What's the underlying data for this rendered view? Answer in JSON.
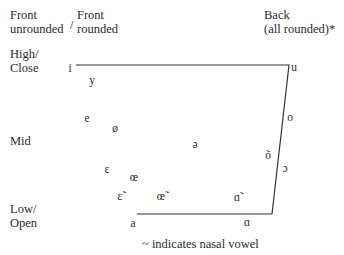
{
  "headers": {
    "front_unrounded": [
      "Front",
      "unrounded"
    ],
    "slash": "/",
    "front_rounded": [
      "Front",
      "rounded"
    ],
    "back": [
      "Back",
      "(all rounded)*"
    ]
  },
  "heights": {
    "high": [
      "High/",
      "Close"
    ],
    "mid": "Mid",
    "low": [
      "Low/",
      "Open"
    ]
  },
  "vowels": [
    {
      "symbol": "i",
      "x": 70,
      "y": 68
    },
    {
      "symbol": "y",
      "x": 92,
      "y": 80
    },
    {
      "symbol": "u",
      "x": 294,
      "y": 67
    },
    {
      "symbol": "e",
      "x": 87,
      "y": 118
    },
    {
      "symbol": "ø",
      "x": 115,
      "y": 128
    },
    {
      "symbol": "ə",
      "x": 195,
      "y": 144
    },
    {
      "symbol": "o",
      "x": 290,
      "y": 117
    },
    {
      "symbol": "õ",
      "x": 268,
      "y": 155
    },
    {
      "symbol": "ɔ",
      "x": 285,
      "y": 168
    },
    {
      "symbol": "ɛ",
      "x": 107,
      "y": 169
    },
    {
      "symbol": "œ",
      "x": 134,
      "y": 177
    },
    {
      "symbol": "ɛ̃",
      "x": 120,
      "y": 196
    },
    {
      "symbol": "œ̃",
      "x": 161,
      "y": 196
    },
    {
      "symbol": "ɑ̃",
      "x": 237,
      "y": 197
    },
    {
      "symbol": "a",
      "x": 133,
      "y": 223
    },
    {
      "symbol": "ɑ",
      "x": 247,
      "y": 222
    }
  ],
  "footnote": "~ indicates nasal vowel",
  "trapezoid": {
    "points": "76,65 289,65 272,214 137,214",
    "stroke": "#333333"
  }
}
